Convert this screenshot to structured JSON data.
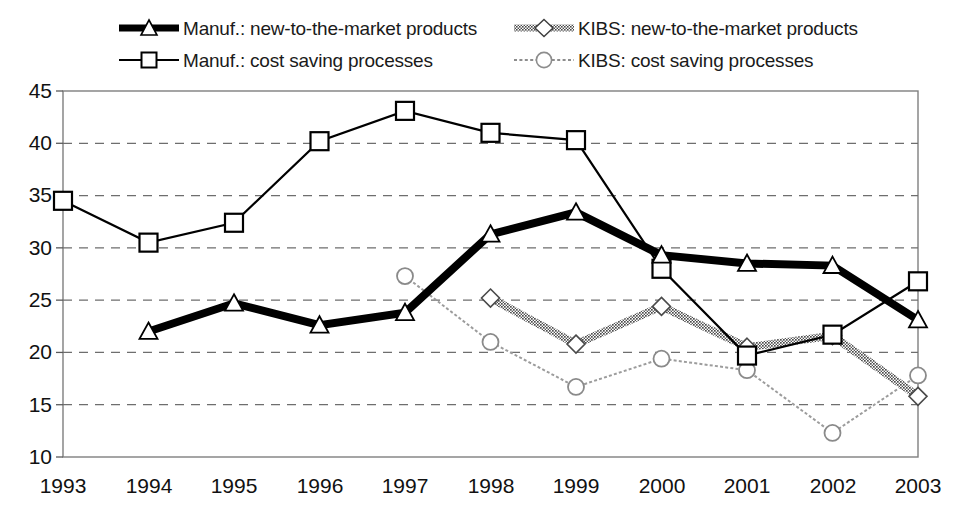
{
  "legend": {
    "items": [
      {
        "id": "manuf-new",
        "label": "Manuf.: new-to-the-market products",
        "marker": "triangle-icon",
        "style": "thick-black",
        "color": "#000000"
      },
      {
        "id": "kibs-new",
        "label": "KIBS: new-to-the-market products",
        "marker": "diamond-icon",
        "style": "thick-hatched",
        "color": "#7a7a7a"
      },
      {
        "id": "manuf-cost",
        "label": "Manuf.: cost saving processes",
        "marker": "square-icon",
        "style": "thin-black",
        "color": "#000000"
      },
      {
        "id": "kibs-cost",
        "label": "KIBS: cost saving processes",
        "marker": "circle-icon",
        "style": "thin-dotted",
        "color": "#9a9a9a"
      }
    ]
  },
  "axes": {
    "y_ticks": [
      "45",
      "40",
      "35",
      "30",
      "25",
      "20",
      "15",
      "10"
    ],
    "x_ticks": [
      "1993",
      "1994",
      "1995",
      "1996",
      "1997",
      "1998",
      "1999",
      "2000",
      "2001",
      "2002",
      "2003"
    ]
  },
  "chart_data": {
    "type": "line",
    "title": "",
    "xlabel": "",
    "ylabel": "",
    "ylim": [
      10,
      45
    ],
    "ytick_step": 5,
    "grid": true,
    "legend_position": "top",
    "x": [
      1993,
      1994,
      1995,
      1996,
      1997,
      1998,
      1999,
      2000,
      2001,
      2002,
      2003
    ],
    "categories": [
      "1993",
      "1994",
      "1995",
      "1996",
      "1997",
      "1998",
      "1999",
      "2000",
      "2001",
      "2002",
      "2003"
    ],
    "series": [
      {
        "name": "Manuf.: new-to-the-market products",
        "marker": "triangle",
        "values": [
          null,
          22.0,
          24.7,
          22.6,
          23.8,
          31.3,
          33.4,
          29.3,
          28.5,
          28.3,
          23.1
        ]
      },
      {
        "name": "Manuf.: cost saving processes",
        "marker": "square",
        "values": [
          34.5,
          30.5,
          32.4,
          40.2,
          43.1,
          41.0,
          40.3,
          28.0,
          19.7,
          21.7,
          26.8
        ]
      },
      {
        "name": "KIBS: new-to-the-market products",
        "marker": "diamond",
        "values": [
          null,
          null,
          null,
          null,
          null,
          25.2,
          20.8,
          24.4,
          20.5,
          21.6,
          15.8
        ]
      },
      {
        "name": "KIBS: cost saving processes",
        "marker": "circle",
        "values": [
          null,
          null,
          null,
          null,
          27.3,
          21.0,
          16.7,
          19.4,
          18.3,
          12.3,
          17.8
        ]
      }
    ]
  }
}
